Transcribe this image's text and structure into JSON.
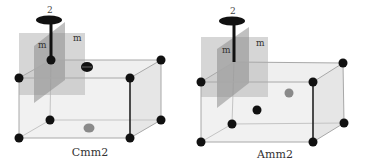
{
  "figure": {
    "panels": [
      {
        "id": "cmm2",
        "caption": "Cmm2",
        "axis_label": "2",
        "mirror_labels": [
          "m",
          "m"
        ],
        "atoms": {
          "corners": "black",
          "face_center_top": "black (with dash)",
          "face_center_bottom": "gray"
        }
      },
      {
        "id": "amm2",
        "caption": "Amm2",
        "axis_label": "2",
        "mirror_labels": [
          "m",
          "m"
        ],
        "atoms": {
          "corners": "black",
          "face_center_front_inner": "black",
          "face_center_back": "gray"
        }
      }
    ],
    "colors": {
      "atom_black": "#111111",
      "atom_gray": "#8a8a8a",
      "cell_edge": "#b5b5b5",
      "cell_fill": "#ececec",
      "mirror_plane": "#b9b9b9",
      "mirror_plane_dark": "#8f8f8f",
      "axis": "#111111"
    }
  }
}
